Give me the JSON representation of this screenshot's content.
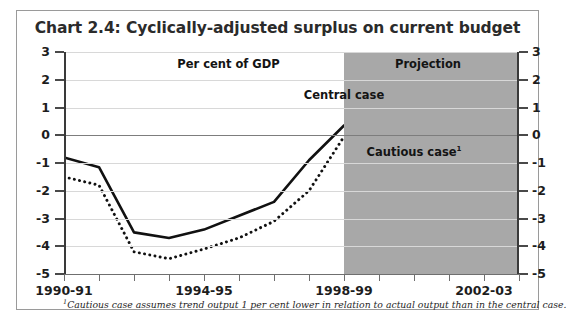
{
  "chart_data": {
    "type": "line",
    "title": "Chart 2.4: Cyclically-adjusted surplus on current budget",
    "xlabel": "",
    "ylabel": "",
    "unit_label": "Per cent of GDP",
    "projection_label": "Projection",
    "ylim": [
      -5,
      3
    ],
    "yticks": [
      3,
      2,
      1,
      0,
      -1,
      -2,
      -3,
      -4,
      -5
    ],
    "ytick_labels_left": [
      "3",
      "2",
      "1",
      "0",
      "-1",
      "-2",
      "-3",
      "-4",
      "-5"
    ],
    "ytick_labels_right": [
      "3",
      "2",
      "1",
      "0",
      "-1",
      "-2",
      "-3",
      "-4",
      "-5"
    ],
    "grid": true,
    "legend_position": "inline-annotations",
    "categories": [
      "1990-91",
      "1991-92",
      "1992-93",
      "1993-94",
      "1994-95",
      "1995-96",
      "1996-97",
      "1997-98",
      "1998-99",
      "1999-00",
      "2000-01",
      "2001-02",
      "2002-03",
      "2003-04"
    ],
    "xtick_labels": [
      "1990-91",
      "1994-95",
      "1998-99",
      "2002-03"
    ],
    "xtick_label_indices": [
      0,
      4,
      8,
      12
    ],
    "projection_starts_at": "1998-99",
    "projection_start_index": 8,
    "series": [
      {
        "name": "Central case",
        "style": "solid",
        "color": "#111111",
        "values": [
          -0.8,
          -1.15,
          -3.5,
          -3.7,
          -3.4,
          -2.9,
          -2.4,
          -0.9,
          0.35,
          0.8,
          1.0,
          1.15,
          0.95,
          1.1
        ]
      },
      {
        "name": "Cautious case",
        "style": "dotted",
        "color": "#111111",
        "values": [
          -1.5,
          -1.8,
          -4.2,
          -4.45,
          -4.1,
          -3.7,
          -3.1,
          -2.0,
          -0.05,
          0.15,
          0.3,
          0.35,
          0.28,
          0.32
        ]
      }
    ],
    "annotations": [
      {
        "text": "Per cent of GDP",
        "x_index": 4.7,
        "y_value": 2.55
      },
      {
        "text": "Projection",
        "x_index": 10.4,
        "y_value": 2.55
      },
      {
        "text": "Central case",
        "x_index": 8.0,
        "y_value": 1.45
      },
      {
        "text": "Cautious case",
        "footnote_marker": "1",
        "x_index": 10.0,
        "y_value": -0.62
      }
    ],
    "footnote": "Cautious case assumes trend output 1 per cent lower in relation to actual output than in the central case.",
    "footnote_marker": "1"
  },
  "colors": {
    "shade": "#a8a8a8",
    "grid": "#d8d8d8",
    "zero_line": "#7d7d7d",
    "axis": "#3a3a3a",
    "line": "#111111",
    "border": "#9a9a9a",
    "title": "#2b2b2b"
  }
}
